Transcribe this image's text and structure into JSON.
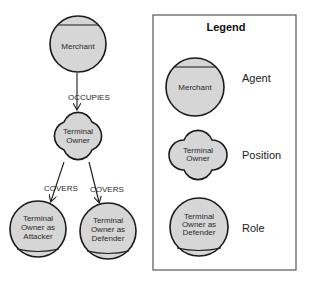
{
  "diagram": {
    "nodes": {
      "merchant": {
        "type": "agent",
        "lines": [
          "Merchant"
        ]
      },
      "terminal_owner": {
        "type": "position",
        "lines": [
          "Terminal",
          "Owner"
        ]
      },
      "attacker": {
        "type": "role",
        "lines": [
          "Terminal",
          "Owner as",
          "Attacker"
        ]
      },
      "defender": {
        "type": "role",
        "lines": [
          "Terminal",
          "Owner as",
          "Defender"
        ]
      }
    },
    "edges": [
      {
        "from": "merchant",
        "to": "terminal_owner",
        "label": "OCCUPIES"
      },
      {
        "from": "terminal_owner",
        "to": "attacker",
        "label": "COVERS"
      },
      {
        "from": "terminal_owner",
        "to": "defender",
        "label": "COVERS"
      }
    ]
  },
  "legend": {
    "title": "Legend",
    "items": [
      {
        "shape": "agent",
        "sample_lines": [
          "Merchant"
        ],
        "label": "Agent"
      },
      {
        "shape": "position",
        "sample_lines": [
          "Terminal",
          "Owner"
        ],
        "label": "Position"
      },
      {
        "shape": "role",
        "sample_lines": [
          "Terminal",
          "Owner as",
          "Defender"
        ],
        "label": "Role"
      }
    ]
  },
  "colors": {
    "node_fill": "#d6d6d6",
    "stroke": "#1a1a1a",
    "legend_border": "#555555"
  }
}
